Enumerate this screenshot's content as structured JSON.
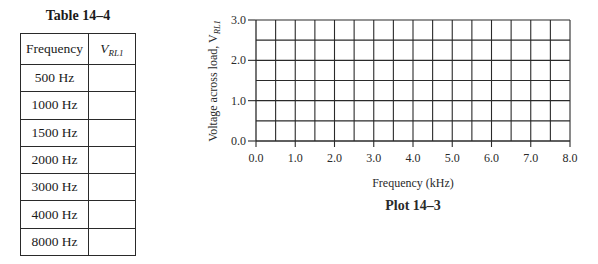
{
  "table": {
    "title": "Table 14–4",
    "headers": {
      "frequency": "Frequency",
      "vrl_main": "V",
      "vrl_sub": "RL1"
    },
    "rows": [
      {
        "frequency": "500 Hz",
        "vrl": ""
      },
      {
        "frequency": "1000 Hz",
        "vrl": ""
      },
      {
        "frequency": "1500 Hz",
        "vrl": ""
      },
      {
        "frequency": "2000 Hz",
        "vrl": ""
      },
      {
        "frequency": "3000 Hz",
        "vrl": ""
      },
      {
        "frequency": "4000 Hz",
        "vrl": ""
      },
      {
        "frequency": "8000 Hz",
        "vrl": ""
      }
    ]
  },
  "chart_data": {
    "type": "line",
    "title": "Plot 14–3",
    "xlabel": "Frequency (kHz)",
    "ylabel_main": "Voltage across load, V",
    "ylabel_sub": "RL1",
    "xlim": [
      0,
      8
    ],
    "ylim": [
      0,
      3
    ],
    "x_ticks": [
      0,
      1,
      2,
      3,
      4,
      5,
      6,
      7,
      8
    ],
    "x_tick_labels": [
      "0.0",
      "1.0",
      "2.0",
      "3.0",
      "4.0",
      "5.0",
      "6.0",
      "7.0",
      "8.0"
    ],
    "y_ticks": [
      0,
      1,
      2,
      3
    ],
    "y_tick_labels": [
      "0.0",
      "1.0",
      "2.0",
      "3.0"
    ],
    "x_grid_step": 0.5,
    "y_grid_step": 0.5,
    "grid": true,
    "series": []
  }
}
